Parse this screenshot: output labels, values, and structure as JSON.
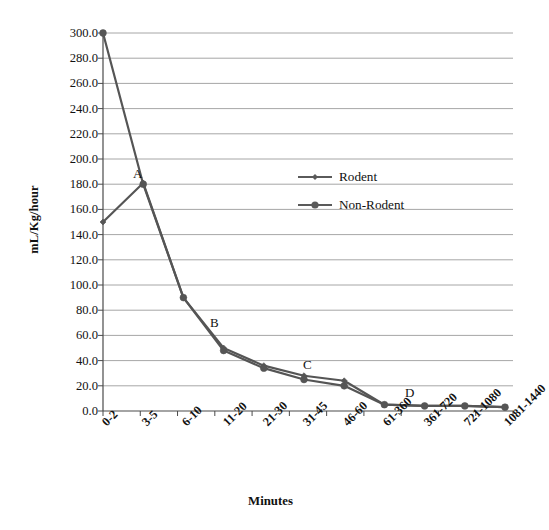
{
  "chart_data": {
    "type": "line",
    "title": "",
    "xlabel": "Minutes",
    "ylabel": "mL/Kg/hour",
    "categories": [
      "0-2",
      "3-5",
      "6-10",
      "11-20",
      "21-30",
      "31-45",
      "46-60",
      "61-360",
      "361-720",
      "721-1080",
      "1081-1440"
    ],
    "ylim": [
      0,
      300
    ],
    "ytick_step": 20,
    "ytick_labels": [
      "300.0",
      "280.0",
      "260.0",
      "240.0",
      "220.0",
      "200.0",
      "180.0",
      "160.0",
      "140.0",
      "120.0",
      "100.0",
      "80.0",
      "60.0",
      "40.0",
      "20.0",
      "0.0"
    ],
    "grid": true,
    "legend_position": "center",
    "series": [
      {
        "name": "Rodent",
        "marker": "diamond",
        "color": "#555555",
        "values": [
          150,
          181,
          90,
          50,
          36,
          28,
          24,
          5,
          4,
          4,
          3
        ]
      },
      {
        "name": "Non-Rodent",
        "marker": "circle",
        "color": "#555555",
        "values": [
          300,
          180,
          90,
          48,
          34,
          25,
          20,
          5,
          4,
          4,
          3
        ]
      }
    ],
    "annotations": [
      {
        "label": "A",
        "x_px": 133,
        "y_px": 166
      },
      {
        "label": "B",
        "x_px": 210,
        "y_px": 315
      },
      {
        "label": "C",
        "x_px": 303,
        "y_px": 357
      },
      {
        "label": "D",
        "x_px": 405,
        "y_px": 385
      }
    ]
  },
  "legend": {
    "items": [
      {
        "label": "Rodent",
        "marker": "diamond"
      },
      {
        "label": "Non-Rodent",
        "marker": "circle"
      }
    ]
  },
  "axes": {
    "x_title": "Minutes",
    "y_title": "mL/Kg/hour"
  },
  "colors": {
    "line": "#5a5a5a",
    "grid": "#8f8f8f",
    "axis": "#4a4a4a",
    "text": "#111111",
    "background": "#ffffff"
  }
}
